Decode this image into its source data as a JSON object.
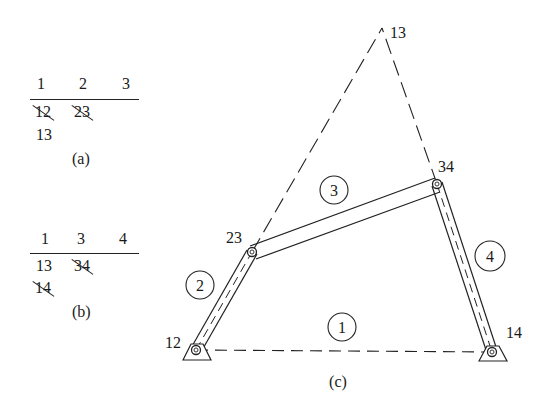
{
  "table_a": {
    "headers": [
      "1",
      "2",
      "3"
    ],
    "rows": [
      [
        {
          "text": "12",
          "struck": true
        },
        {
          "text": "23",
          "struck": true
        }
      ],
      [
        {
          "text": "13",
          "struck": false
        }
      ]
    ],
    "caption": "(a)"
  },
  "table_b": {
    "headers": [
      "1",
      "3",
      "4"
    ],
    "rows": [
      [
        {
          "text": "13",
          "struck": false
        },
        {
          "text": "34",
          "struck": true
        }
      ],
      [
        {
          "text": "14",
          "struck": true
        }
      ]
    ],
    "caption": "(b)"
  },
  "mechanism": {
    "caption": "(c)",
    "joints": {
      "j12": {
        "label": "12",
        "x": 196,
        "y": 350
      },
      "j23": {
        "label": "23",
        "x": 252,
        "y": 252
      },
      "j34": {
        "label": "34",
        "x": 437,
        "y": 184
      },
      "j14": {
        "label": "14",
        "x": 492,
        "y": 352
      },
      "j13": {
        "label": "13",
        "x": 382,
        "y": 28
      }
    },
    "links": [
      {
        "id": "1",
        "label": "1",
        "type": "ground",
        "circle": {
          "x": 342,
          "y": 327
        }
      },
      {
        "id": "2",
        "label": "2",
        "type": "crank",
        "circle": {
          "x": 199,
          "y": 284
        }
      },
      {
        "id": "3",
        "label": "3",
        "type": "coupler",
        "circle": {
          "x": 334,
          "y": 190
        }
      },
      {
        "id": "4",
        "label": "4",
        "type": "rocker",
        "circle": {
          "x": 490,
          "y": 256
        }
      }
    ]
  }
}
